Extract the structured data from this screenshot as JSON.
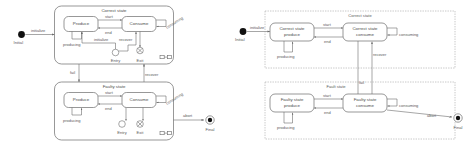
{
  "figure": {
    "type": "uml-state-machine",
    "panels": [
      {
        "id": "left",
        "name": "hierarchical-state-machine",
        "initial_label": "Initial",
        "final_label": "Final",
        "initial_transition": "initialize",
        "final_transition": "abort",
        "composite_states": [
          {
            "name": "Correct state",
            "corner_icon": "composite-state-icon",
            "substates": [
              "Produce",
              "Consume"
            ],
            "entry_point_label": "Entry",
            "exit_point_label": "Exit",
            "transitions": [
              "start",
              "end",
              "producing",
              "consuming",
              "initialize",
              "recover"
            ]
          },
          {
            "name": "Faulty state",
            "corner_icon": "composite-state-icon",
            "substates": [
              "Produce",
              "Consume"
            ],
            "entry_point_label": "Entry",
            "exit_point_label": "Exit",
            "transitions": [
              "start",
              "end",
              "producing",
              "consuming"
            ]
          }
        ],
        "inter_state_transitions": [
          "fail",
          "recover"
        ]
      },
      {
        "id": "right",
        "name": "flattened-state-machine",
        "initial_label": "Initial",
        "final_label": "Final",
        "initial_transition": "initialize",
        "final_transition": "abort",
        "regions": [
          {
            "name": "Correct state",
            "states": [
              "Correct state produce",
              "Correct state consume"
            ],
            "transitions": [
              "start",
              "end",
              "producing",
              "consuming"
            ]
          },
          {
            "name": "Fault state",
            "states": [
              "Faulty state produce",
              "Faulty state consume"
            ],
            "transitions": [
              "start",
              "end",
              "producing",
              "consuming"
            ]
          }
        ],
        "inter_region_transitions": [
          "fail",
          "recover"
        ]
      }
    ],
    "colors": {
      "stroke": "#6b6b6b",
      "dashed_region": "#9a9a9a",
      "text": "#5a5a5a",
      "node_fill": "#ffffff",
      "pseudostate_fill": "#111111",
      "background": "#ffffff"
    }
  }
}
